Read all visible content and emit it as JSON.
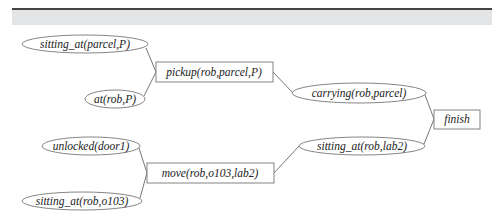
{
  "diagram": {
    "type": "plan-graph",
    "nodes": [
      {
        "id": "n1",
        "kind": "condition",
        "label": "sitting_at(parcel,P)",
        "cx": 85,
        "cy": 44,
        "rx": 63,
        "ry": 9
      },
      {
        "id": "n2",
        "kind": "condition",
        "label": "at(rob,P)",
        "cx": 115,
        "cy": 99,
        "rx": 30,
        "ry": 9
      },
      {
        "id": "n3",
        "kind": "action",
        "label": "pickup(rob,parcel,P)",
        "x": 156,
        "y": 62,
        "w": 117,
        "h": 20
      },
      {
        "id": "n4",
        "kind": "condition",
        "label": "carrying(rob,parcel)",
        "cx": 359,
        "cy": 93,
        "rx": 67,
        "ry": 10
      },
      {
        "id": "n5",
        "kind": "action",
        "label": "finish",
        "x": 434,
        "y": 110,
        "w": 46,
        "h": 19
      },
      {
        "id": "n6",
        "kind": "condition",
        "label": "unlocked(door1)",
        "cx": 91,
        "cy": 146,
        "rx": 49,
        "ry": 9
      },
      {
        "id": "n7",
        "kind": "condition",
        "label": "sitting_at(rob,o103)",
        "cx": 82,
        "cy": 201,
        "rx": 60,
        "ry": 9
      },
      {
        "id": "n8",
        "kind": "action",
        "label": "move(rob,o103,lab2)",
        "x": 147,
        "y": 163,
        "w": 127,
        "h": 20
      },
      {
        "id": "n9",
        "kind": "condition",
        "label": "sitting_at(rob,lab2)",
        "cx": 362,
        "cy": 146,
        "rx": 63,
        "ry": 9
      }
    ],
    "edges": [
      {
        "from": "n1",
        "to": "n3"
      },
      {
        "from": "n2",
        "to": "n3"
      },
      {
        "from": "n3",
        "to": "n4"
      },
      {
        "from": "n4",
        "to": "n5"
      },
      {
        "from": "n6",
        "to": "n8"
      },
      {
        "from": "n7",
        "to": "n8"
      },
      {
        "from": "n8",
        "to": "n9"
      },
      {
        "from": "n9",
        "to": "n5"
      }
    ]
  }
}
